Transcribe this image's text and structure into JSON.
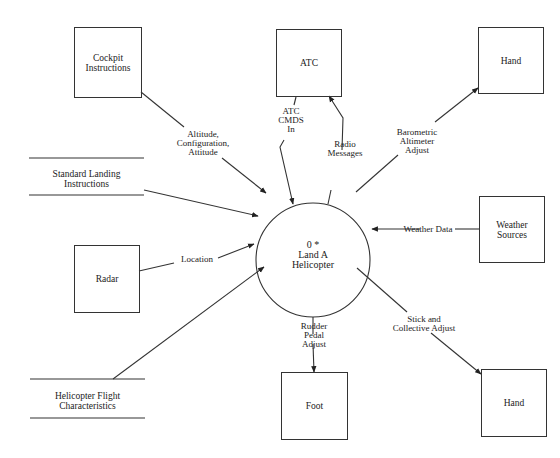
{
  "diagram": {
    "type": "context-data-flow-diagram",
    "process": {
      "id": "0 *",
      "name_line1": "Land A",
      "name_line2": "Helicopter"
    },
    "external_entities": {
      "cockpit": {
        "line1": "Cockpit",
        "line2": "Instructions"
      },
      "atc": {
        "label": "ATC"
      },
      "hand_top": {
        "label": "Hand"
      },
      "weather": {
        "line1": "Weather",
        "line2": "Sources"
      },
      "radar": {
        "label": "Radar"
      },
      "foot": {
        "label": "Foot"
      },
      "hand_bottom": {
        "label": "Hand"
      }
    },
    "data_stores": {
      "standard_landing": {
        "line1": "Standard Landing",
        "line2": "Instructions"
      },
      "flight_characteristics": {
        "line1": "Helicopter Flight",
        "line2": "Characteristics"
      }
    },
    "flows": {
      "altitude": {
        "line1": "Altitude,",
        "line2": "Configuration,",
        "line3": "Attitude"
      },
      "atc_cmds": {
        "line1": "ATC",
        "line2": "CMDS",
        "line3": "In"
      },
      "radio": {
        "line1": "Radio",
        "line2": "Messages"
      },
      "barometric": {
        "line1": "Barometric",
        "line2": "Altimeter",
        "line3": "Adjust"
      },
      "weather_data": {
        "label": "Weather Data"
      },
      "location": {
        "label": "Location"
      },
      "rudder": {
        "line1": "Rudder",
        "line2": "Pedal",
        "line3": "Adjust"
      },
      "stick": {
        "line1": "Stick and",
        "line2": "Collective Adjust"
      }
    }
  }
}
